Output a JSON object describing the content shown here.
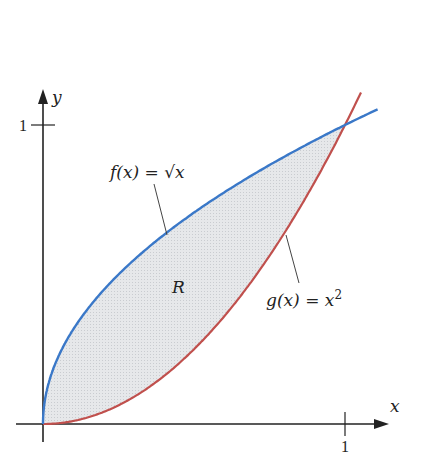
{
  "diagram": {
    "type": "area-between-curves",
    "axes": {
      "x_label": "x",
      "y_label": "y",
      "x_tick_label": "1",
      "y_tick_label": "1",
      "x_range": [
        0,
        1.1
      ],
      "y_range": [
        0,
        1.1
      ]
    },
    "curves": [
      {
        "name": "f",
        "label": "f(x) = √x",
        "expression": "sqrt(x)",
        "color": "#3a78c8"
      },
      {
        "name": "g",
        "label_prefix": "g(x) = x",
        "label_exponent": "2",
        "expression": "x^2",
        "color": "#c0504d"
      }
    ],
    "region": {
      "label": "R",
      "fill": "#dcdfe3",
      "bounded_by": [
        "f",
        "g"
      ],
      "x_interval": [
        0,
        1
      ]
    },
    "intersection_points": [
      [
        0,
        0
      ],
      [
        1,
        1
      ]
    ],
    "colors": {
      "axis": "#222222",
      "f_curve": "#3a78c8",
      "g_curve": "#c0504d",
      "region_fill": "#dcdfe3",
      "leader_line": "#444444"
    }
  }
}
